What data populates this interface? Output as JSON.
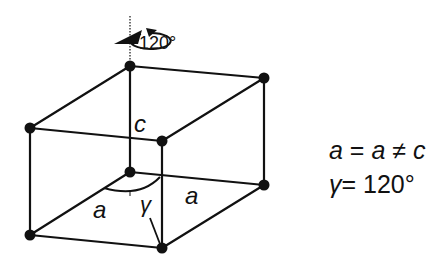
{
  "diagram": {
    "rotation_label": "120°",
    "labels": {
      "c": "c",
      "a_left": "a",
      "a_right": "a",
      "gamma": "γ"
    },
    "conditions": {
      "line1": {
        "a1": "a",
        "eq": " = ",
        "a2": "a",
        "neq": " ≠ ",
        "c": "c"
      },
      "line2": {
        "gamma": "γ",
        "eq": "= ",
        "value": "120°"
      }
    },
    "colors": {
      "line": "#111111",
      "background": "#ffffff"
    }
  }
}
